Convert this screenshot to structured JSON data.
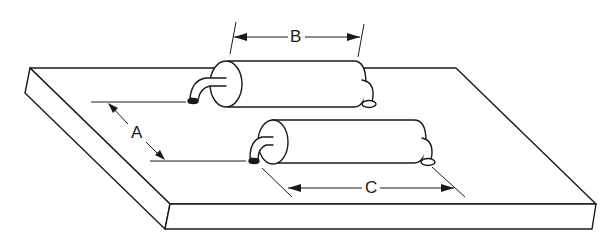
{
  "diagram": {
    "labels": {
      "a": "A",
      "b": "B",
      "c": "C"
    },
    "dimensions": [
      {
        "label": "A",
        "meaning": "spacing between the two components"
      },
      {
        "label": "B",
        "meaning": "body length of upper component"
      },
      {
        "label": "C",
        "meaning": "lead-to-lead span of lower component"
      }
    ],
    "colors": {
      "line": "#1a1a1a",
      "background": "#ffffff"
    }
  }
}
